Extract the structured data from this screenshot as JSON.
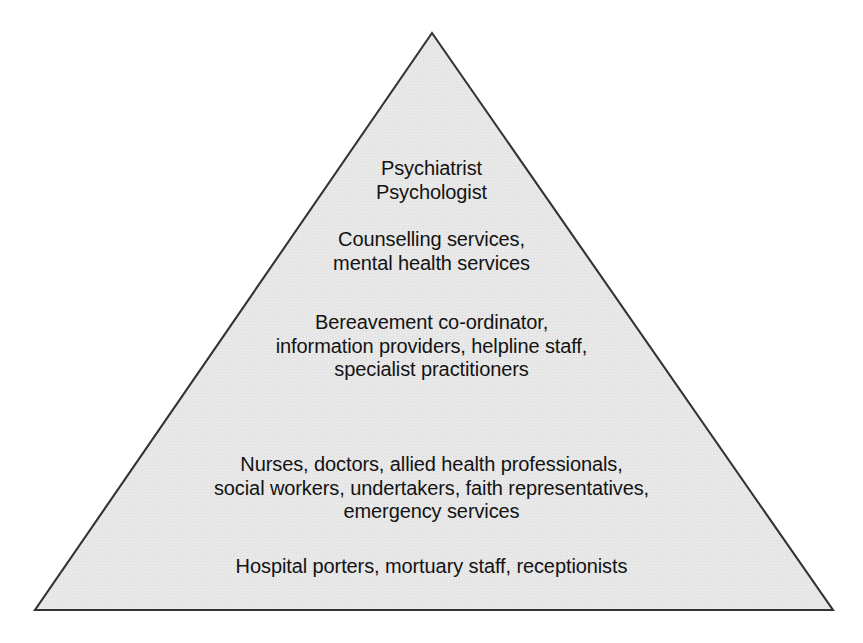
{
  "diagram": {
    "type": "pyramid",
    "orientation": "apex-up",
    "tier_count": 5,
    "dividers_visible": false,
    "geometry": {
      "apex": {
        "x": 432,
        "y": 33
      },
      "bottom_left": {
        "x": 35,
        "y": 610
      },
      "bottom_right": {
        "x": 833,
        "y": 610
      }
    },
    "colors": {
      "background": "#ffffff",
      "fill": "#e8e8e8",
      "stroke": "#333333",
      "text": "#131313"
    },
    "tiers": [
      {
        "level": 1,
        "position": "apex",
        "lines": [
          "Psychiatrist",
          "Psychologist"
        ],
        "text": "Psychiatrist\nPsychologist"
      },
      {
        "level": 2,
        "position": "upper",
        "lines": [
          "Counselling services,",
          "mental health services"
        ],
        "text": "Counselling services,\nmental health services"
      },
      {
        "level": 3,
        "position": "middle",
        "lines": [
          "Bereavement co-ordinator,",
          "information providers, helpline staff,",
          "specialist practitioners"
        ],
        "text": "Bereavement co-ordinator,\ninformation providers, helpline staff,\nspecialist practitioners"
      },
      {
        "level": 4,
        "position": "lower",
        "lines": [
          "Nurses, doctors, allied health professionals,",
          "social workers, undertakers, faith representatives,",
          "emergency services"
        ],
        "text": "Nurses, doctors, allied health professionals,\nsocial workers, undertakers, faith representatives,\nemergency services"
      },
      {
        "level": 5,
        "position": "base",
        "lines": [
          "Hospital porters, mortuary staff, receptionists"
        ],
        "text": "Hospital porters, mortuary staff, receptionists"
      }
    ]
  }
}
